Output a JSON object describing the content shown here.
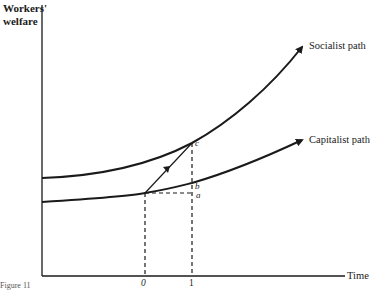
{
  "diagram": {
    "y_axis_label_line1": "Workers'",
    "y_axis_label_line2": "welfare",
    "x_axis_label": "Time",
    "curves": [
      {
        "name": "Socialist path",
        "label": "Socialist path"
      },
      {
        "name": "Capitalist path",
        "label": "Capitalist path"
      }
    ],
    "points": {
      "c": "c",
      "b": "b",
      "a": "a"
    },
    "ticks": [
      "0",
      "1"
    ],
    "caption": "Figure 11"
  }
}
